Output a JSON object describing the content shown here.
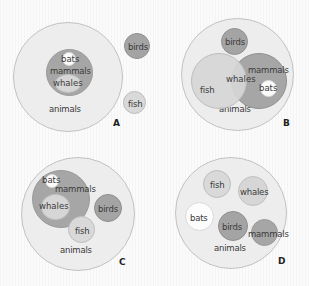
{
  "figure": {
    "type": "set-diagram-grid",
    "colors": {
      "animals_fill": "#ededed",
      "mammals_fill": "#a6a6a6",
      "birds_fill": "#a4a4a4",
      "fish_fill": "#d9d9d9",
      "whales_fill": "#d6d6d6",
      "bats_fill": "#fcfcfc",
      "outline": "#c2c2c2",
      "label_text": "#3a3a3a",
      "panel_letter": "#1f1f1f",
      "background": "#fbfbfb"
    }
  },
  "panels": [
    {
      "letter": "A",
      "sets": {
        "animals": "animals",
        "mammals": "mammals",
        "bats": "bats",
        "whales": "whales",
        "birds": "birds",
        "fish": "fish"
      }
    },
    {
      "letter": "B",
      "sets": {
        "animals": "animals",
        "mammals": "mammals",
        "bats": "bats",
        "whales": "whales",
        "birds": "birds",
        "fish": "fish"
      }
    },
    {
      "letter": "C",
      "sets": {
        "animals": "animals",
        "mammals": "mammals",
        "bats": "bats",
        "whales": "whales",
        "birds": "birds",
        "fish": "fish"
      }
    },
    {
      "letter": "D",
      "sets": {
        "animals": "animals",
        "mammals": "mammals",
        "bats": "bats",
        "whales": "whales",
        "birds": "birds",
        "fish": "fish"
      }
    }
  ]
}
